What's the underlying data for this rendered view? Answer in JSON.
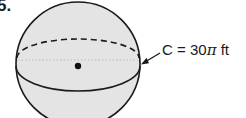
{
  "problem": {
    "number": "5."
  },
  "figure": {
    "shape": "sphere",
    "fill_color": "#e4e4e4",
    "stroke_color": "#1a1a1a",
    "annotation": {
      "variable": "C",
      "equals": "=",
      "coefficient": "30",
      "pi": "π",
      "unit": "ft",
      "full_text": "C = 30π ft"
    }
  }
}
